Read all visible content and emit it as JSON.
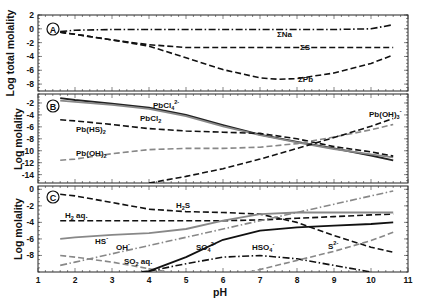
{
  "chart_data": [
    {
      "panel": "A",
      "type": "line",
      "ylabel": "Log total molality",
      "xlabel": "",
      "xlim": [
        1,
        11
      ],
      "ylim": [
        -9,
        2
      ],
      "yticks": [
        2,
        0,
        -2,
        -4,
        -6,
        -8
      ],
      "series": [
        {
          "name": "ΣNa",
          "style": "dashdot",
          "color": "#111111",
          "x": [
            1.6,
            2,
            3,
            4,
            5,
            6,
            7,
            8,
            9,
            10,
            10.6
          ],
          "y": [
            -0.4,
            -0.2,
            -0.1,
            -0.1,
            -0.1,
            -0.1,
            -0.1,
            -0.1,
            -0.1,
            0.0,
            0.6
          ]
        },
        {
          "name": "ΣS",
          "style": "dashed",
          "color": "#111111",
          "x": [
            1.6,
            2,
            3,
            4,
            5,
            6,
            7,
            8,
            9,
            10,
            10.6
          ],
          "y": [
            -0.5,
            -0.8,
            -1.6,
            -2.3,
            -2.7,
            -2.7,
            -2.7,
            -2.7,
            -2.7,
            -2.7,
            -2.7
          ]
        },
        {
          "name": "ΣPb",
          "style": "dashed",
          "color": "#111111",
          "x": [
            1.6,
            2,
            3,
            4,
            5,
            6,
            7,
            7.5,
            8,
            9,
            10,
            10.6
          ],
          "y": [
            -0.5,
            -0.8,
            -1.6,
            -2.5,
            -4.2,
            -5.9,
            -7.1,
            -7.3,
            -7.2,
            -6.4,
            -5.0,
            -3.8
          ]
        }
      ],
      "annotations": [
        "ΣNa",
        "ΣS",
        "ΣPb"
      ]
    },
    {
      "panel": "B",
      "type": "line",
      "ylabel": "Log molality",
      "xlabel": "",
      "xlim": [
        1,
        11
      ],
      "ylim": [
        -15.4,
        -0.5
      ],
      "yticks": [
        -2,
        -4,
        -6,
        -8,
        -10,
        -12,
        -14
      ],
      "series": [
        {
          "name": "PbCl4 2-",
          "style": "solid",
          "color": "#222222",
          "x": [
            1.6,
            2,
            3,
            4,
            5,
            6,
            7,
            8,
            9,
            10,
            10.6
          ],
          "y": [
            -1.2,
            -1.5,
            -2.1,
            -2.8,
            -4.0,
            -5.7,
            -7.3,
            -8.5,
            -9.6,
            -10.8,
            -11.6
          ]
        },
        {
          "name": "PbCl2",
          "style": "solid",
          "color": "#888888",
          "x": [
            1.6,
            2,
            3,
            4,
            5,
            6,
            7,
            8,
            9,
            10,
            10.6
          ],
          "y": [
            -1.6,
            -1.8,
            -2.3,
            -3.0,
            -4.2,
            -5.9,
            -7.4,
            -8.6,
            -9.7,
            -10.6,
            -11.1
          ]
        },
        {
          "name": "Pb(HS)2",
          "style": "dashed",
          "color": "#111111",
          "x": [
            1.6,
            2,
            3,
            4,
            5,
            6,
            7,
            8,
            9,
            10,
            10.6
          ],
          "y": [
            -4.8,
            -5.0,
            -5.6,
            -6.3,
            -6.7,
            -6.9,
            -7.1,
            -8.0,
            -9.3,
            -10.2,
            -10.9
          ]
        },
        {
          "name": "Pb(OH)2",
          "style": "dashed",
          "color": "#888888",
          "x": [
            1.6,
            2,
            3,
            4,
            5,
            6,
            7,
            8,
            9,
            10,
            10.6
          ],
          "y": [
            -11.6,
            -11.4,
            -10.5,
            -9.8,
            -9.6,
            -9.6,
            -9.4,
            -8.8,
            -7.7,
            -6.5,
            -5.6
          ]
        },
        {
          "name": "Pb(OH)3 -",
          "style": "dashed",
          "color": "#111111",
          "x": [
            4,
            5,
            6,
            7,
            8,
            9,
            10,
            10.6
          ],
          "y": [
            -15.4,
            -14.3,
            -13.0,
            -11.4,
            -9.6,
            -7.8,
            -5.9,
            -4.6
          ]
        }
      ],
      "annotations": [
        "PbCl4 2-",
        "PbCl2",
        "Pb(HS)2",
        "Pb(OH)2",
        "Pb(OH)3 -"
      ]
    },
    {
      "panel": "C",
      "type": "line",
      "ylabel": "Log molality",
      "xlabel": "pH",
      "xlim": [
        1,
        11
      ],
      "xticks": [
        1,
        2,
        3,
        4,
        5,
        6,
        7,
        8,
        9,
        10,
        11
      ],
      "ylim": [
        -10,
        0.4
      ],
      "yticks": [
        0,
        -2,
        -4,
        -6,
        -8
      ],
      "series": [
        {
          "name": "H2S",
          "style": "dashed",
          "color": "#111111",
          "x": [
            1.6,
            2,
            3,
            4,
            5,
            6,
            7,
            8,
            9,
            10,
            10.6
          ],
          "y": [
            -0.6,
            -0.8,
            -1.6,
            -2.4,
            -2.7,
            -2.8,
            -3.0,
            -4.0,
            -5.6,
            -7.0,
            -7.6
          ]
        },
        {
          "name": "H2 aq.",
          "style": "dashed",
          "color": "#111111",
          "x": [
            1.6,
            2,
            3,
            4,
            5,
            6,
            7,
            8,
            9,
            10,
            10.6
          ],
          "y": [
            -3.8,
            -3.8,
            -3.8,
            -3.8,
            -3.8,
            -3.8,
            -3.7,
            -3.5,
            -3.3,
            -3.1,
            -3.0
          ]
        },
        {
          "name": "HS-",
          "style": "solid",
          "color": "#888888",
          "x": [
            1.6,
            2,
            3,
            4,
            5,
            6,
            7,
            8,
            9,
            10,
            10.6
          ],
          "y": [
            -6.0,
            -5.8,
            -5.5,
            -5.3,
            -4.8,
            -3.8,
            -3.0,
            -2.8,
            -2.8,
            -2.8,
            -2.8
          ]
        },
        {
          "name": "OH-",
          "style": "dashdot",
          "color": "#888888",
          "x": [
            1.6,
            2,
            3,
            4,
            5,
            6,
            7,
            8,
            9,
            10,
            10.6
          ],
          "y": [
            -9.2,
            -8.8,
            -7.8,
            -6.8,
            -5.8,
            -4.8,
            -3.8,
            -2.8,
            -1.8,
            -0.8,
            -0.2
          ]
        },
        {
          "name": "SO2 aq.",
          "style": "dashed",
          "color": "#888888",
          "x": [
            1.6,
            2,
            3,
            4,
            4.5
          ],
          "y": [
            -8.0,
            -8.2,
            -8.8,
            -9.6,
            -10.0
          ]
        },
        {
          "name": "SO4 2-",
          "style": "solid",
          "color": "#111111",
          "x": [
            3.8,
            4,
            5,
            6,
            7,
            8,
            9,
            10,
            10.6
          ],
          "y": [
            -10.0,
            -9.9,
            -8.2,
            -6.1,
            -5.0,
            -4.6,
            -4.4,
            -4.2,
            -4.0
          ]
        },
        {
          "name": "HSO4-",
          "style": "dashdot",
          "color": "#111111",
          "x": [
            4,
            5,
            6,
            7,
            8,
            9,
            10
          ],
          "y": [
            -9.9,
            -9.0,
            -8.2,
            -8.0,
            -8.4,
            -9.2,
            -10.0
          ]
        },
        {
          "name": "S2-",
          "style": "dashed",
          "color": "#888888",
          "x": [
            6.7,
            7,
            8,
            9,
            10,
            10.6
          ],
          "y": [
            -10.0,
            -9.7,
            -8.6,
            -7.5,
            -6.2,
            -5.2
          ]
        }
      ],
      "annotations": [
        "H2S",
        "H2 aq.",
        "HS-",
        "OH-",
        "SO2 aq.",
        "SO4 2-",
        "HSO4-",
        "S2-"
      ]
    }
  ],
  "panels": {
    "a": {
      "label": "A",
      "ylabel": "Log total molality",
      "yticks": [
        "2",
        "0",
        "-2",
        "-4",
        "-6",
        "-8"
      ],
      "labels": {
        "na": "ΣNa",
        "s": "ΣS",
        "pb": "ΣPb"
      }
    },
    "b": {
      "label": "B",
      "ylabel": "Log molality",
      "yticks": [
        "-2",
        "-4",
        "-6",
        "-8",
        "-10",
        "-12",
        "-14"
      ],
      "labels": {
        "pbcl4": "PbCl",
        "pbcl4_sub": "4",
        "pbcl4_sup": "2-",
        "pbcl2": "PbCl",
        "pbcl2_sub": "2",
        "pbhs2": "Pb(HS)",
        "pbhs2_sub": "2",
        "pboh2": "Pb(OH)",
        "pboh2_sub": "2",
        "pboh3": "Pb(OH)",
        "pboh3_sub": "3",
        "pboh3_sup": "-"
      }
    },
    "c": {
      "label": "C",
      "ylabel": "Log molality",
      "yticks": [
        "0",
        "-2",
        "-4",
        "-6",
        "-8"
      ],
      "labels": {
        "h2s": "H",
        "h2s_sub": "2",
        "h2s_end": "S",
        "h2aq": "H",
        "h2aq_sub": "2",
        "h2aq_end": " aq.",
        "hs": "HS",
        "hs_sup": "-",
        "oh": "OH",
        "oh_sup": "-",
        "so2": "SO",
        "so2_sub": "2",
        "so2_end": " aq.",
        "so4": "SO",
        "so4_sub": "4",
        "so4_sup": "2-",
        "hso4": "HSO",
        "hso4_sub": "4",
        "hso4_sup": "-",
        "s2": "S",
        "s2_sup": "2-"
      }
    }
  },
  "xaxis": {
    "label": "pH",
    "ticks": [
      "1",
      "2",
      "3",
      "4",
      "5",
      "6",
      "7",
      "8",
      "9",
      "10",
      "11"
    ]
  },
  "colors": {
    "black": "#111111",
    "gray": "#888888"
  }
}
